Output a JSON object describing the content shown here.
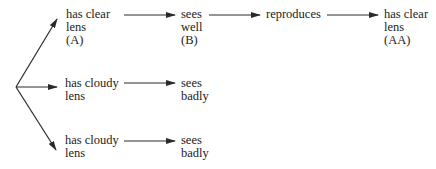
{
  "diagram": {
    "rows": [
      {
        "nodes": [
          {
            "lines": [
              "has clear",
              "lens",
              "(A)"
            ]
          },
          {
            "lines": [
              "sees",
              "well",
              "(B)"
            ]
          },
          {
            "lines": [
              "reproduces"
            ]
          },
          {
            "lines": [
              "has clear",
              "lens",
              "(AA)"
            ]
          }
        ]
      },
      {
        "nodes": [
          {
            "lines": [
              "has cloudy",
              "lens"
            ]
          },
          {
            "lines": [
              "sees",
              "badly"
            ]
          }
        ]
      },
      {
        "nodes": [
          {
            "lines": [
              "has cloudy",
              "lens"
            ]
          },
          {
            "lines": [
              "sees",
              "badly"
            ]
          }
        ]
      }
    ],
    "colors": {
      "line": "#2a2a2a",
      "text": "#222222"
    }
  }
}
